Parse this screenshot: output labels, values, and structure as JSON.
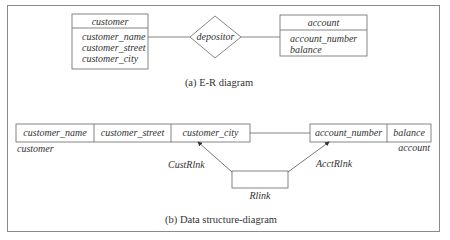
{
  "er_diagram": {
    "caption": "(a) E-R diagram",
    "entities": [
      {
        "name": "customer",
        "attributes": [
          "customer_name",
          "customer_street",
          "customer_city"
        ]
      },
      {
        "name": "account",
        "attributes": [
          "account_number",
          "balance"
        ]
      }
    ],
    "relationship": "depositor"
  },
  "data_structure_diagram": {
    "caption": "(b) Data structure-diagram",
    "customer_record": {
      "label": "customer",
      "fields": [
        "customer_name",
        "customer_street",
        "customer_city"
      ]
    },
    "account_record": {
      "label": "account",
      "fields": [
        "account_number",
        "balance"
      ]
    },
    "link_record": {
      "label": "Rlink"
    },
    "links": [
      {
        "label": "CustRlnk"
      },
      {
        "label": "AcctRlnk"
      }
    ]
  }
}
